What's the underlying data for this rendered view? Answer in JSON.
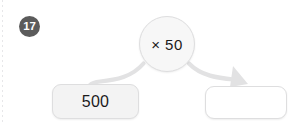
{
  "worksheet": {
    "question_number": "17",
    "margin_rule": "dotted-margin-line"
  },
  "diagram": {
    "type": "function-machine",
    "operator_node": {
      "label": "× 50",
      "shape": "circle",
      "icon": "multiply-icon"
    },
    "input_box": {
      "value": "500",
      "state": "filled"
    },
    "output_box": {
      "value": "",
      "state": "empty",
      "placeholder": ""
    },
    "connectors": [
      {
        "name": "left-arc",
        "from": "operator_node",
        "to": "input_box",
        "arrowhead": false
      },
      {
        "name": "right-arrow",
        "from": "operator_node",
        "to": "output_box",
        "arrowhead": true
      }
    ]
  },
  "colors": {
    "badge_fill": "#5b5b5b",
    "badge_text": "#ffffff",
    "node_fill": "#f7f7f7",
    "box_fill": "#f3f3f3",
    "empty_box_fill": "#ffffff",
    "stroke": "#dededf",
    "arrow": "#e2e2e3",
    "text": "#1b1b1b"
  }
}
